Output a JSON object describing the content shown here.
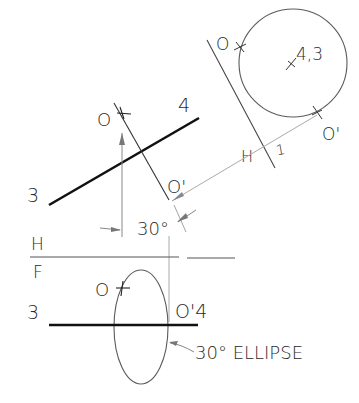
{
  "diagram": {
    "colors": {
      "ink": "#1a1a1a",
      "thin": "#6a6a6a",
      "projection": "#a8a8a8",
      "background": "#ffffff"
    },
    "auxiliary_view": {
      "circle_center_label": "4,3",
      "point_o_label": "O",
      "point_o_prime_label": "O'",
      "fold_label_left": "H",
      "fold_label_right": "1"
    },
    "top_view": {
      "endpoint_left_label": "3",
      "endpoint_right_label": "4",
      "point_o_label": "O",
      "point_o_prime_label": "O'",
      "angle_label": "30°"
    },
    "fold_line_hf": {
      "upper_label": "H",
      "lower_label": "F"
    },
    "front_view": {
      "endpoint_left_label": "3",
      "point_o_label": "O",
      "point_o_prime_4_label": "O'4",
      "ellipse_callout": "30° ELLIPSE"
    }
  }
}
